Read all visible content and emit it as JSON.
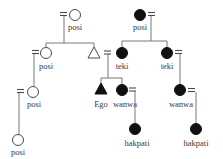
{
  "diagram": {
    "type": "kinship-chart",
    "colors": {
      "filled": "#111111",
      "line": "#6a6a6a",
      "background": "#ffffff"
    },
    "legend_symbols": {
      "circle": "female",
      "triangle": "male",
      "filled": "marked-kin",
      "equals": "marriage"
    },
    "nodes": [
      {
        "id": "n1",
        "shape": "circle",
        "filled": false,
        "label": "posi"
      },
      {
        "id": "n2",
        "shape": "circle",
        "filled": true,
        "label": "posi"
      },
      {
        "id": "n3",
        "shape": "circle",
        "filled": false,
        "label": "posi"
      },
      {
        "id": "n4",
        "shape": "triangle",
        "filled": false,
        "label": ""
      },
      {
        "id": "n5",
        "shape": "circle",
        "filled": true,
        "label": "teki"
      },
      {
        "id": "n6",
        "shape": "circle",
        "filled": true,
        "label": "teki"
      },
      {
        "id": "n7",
        "shape": "circle",
        "filled": false,
        "label": "posi"
      },
      {
        "id": "n8",
        "shape": "triangle",
        "filled": true,
        "label": "Ego"
      },
      {
        "id": "n9",
        "shape": "circle",
        "filled": true,
        "label": "wanwa"
      },
      {
        "id": "n10",
        "shape": "circle",
        "filled": true,
        "label": "wanwa"
      },
      {
        "id": "n11",
        "shape": "circle",
        "filled": false,
        "label": "posi"
      },
      {
        "id": "n12",
        "shape": "circle",
        "filled": true,
        "label": "hakpati"
      },
      {
        "id": "n13",
        "shape": "circle",
        "filled": true,
        "label": "hakpati"
      }
    ],
    "labels": {
      "top_left_posi": "posi",
      "top_right_posi": "posi",
      "mid_left_posi": "posi",
      "teki_left": "teki",
      "teki_right": "teki",
      "lower_left_posi": "posi",
      "ego": "Ego",
      "wanwa_left": "wanwa",
      "wanwa_right": "wanwa",
      "bottom_left_posi": "posi",
      "hakpati_left": "hakpati",
      "hakpati_right": "hakpati"
    }
  }
}
